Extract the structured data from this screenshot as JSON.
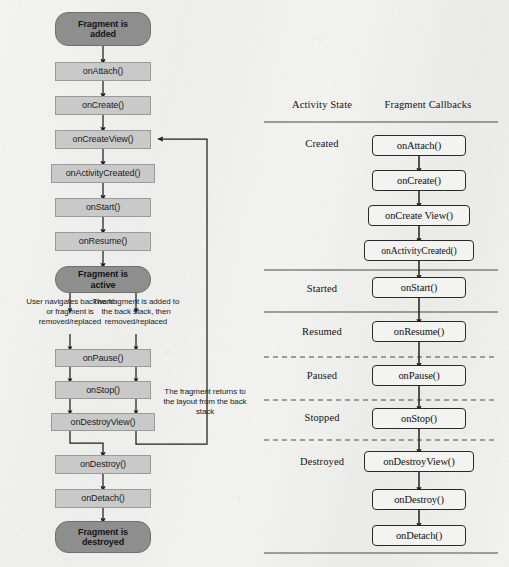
{
  "flow": {
    "start_node": "Fragment is\nadded",
    "start_line1": "Fragment is",
    "start_line2": "added",
    "active_line1": "Fragment is",
    "active_line2": "active",
    "end_line1": "Fragment is",
    "end_line2": "destroyed",
    "callbacks": [
      {
        "label": "onAttach()"
      },
      {
        "label": "onCreate()"
      },
      {
        "label": "onCreateView()"
      },
      {
        "label": "onActivityCreated()"
      },
      {
        "label": "onStart()"
      },
      {
        "label": "onResume()"
      },
      {
        "label": "onPause()"
      },
      {
        "label": "onStop()"
      },
      {
        "label": "onDestroyView()"
      },
      {
        "label": "onDestroy()"
      },
      {
        "label": "onDetach()"
      }
    ],
    "annotations": {
      "left_branch": "User navigates backward or fragment is removed/replaced",
      "right_branch": "The fragment is added to the back stack, then removed/replaced",
      "return_branch": "The fragment returns to the layout from the back stack"
    }
  },
  "table": {
    "headers": {
      "state": "Activity State",
      "callbacks": "Fragment Callbacks"
    },
    "rows": [
      {
        "state": "Created",
        "callbacks": [
          "onAttach()",
          "onCreate()",
          "onCreate View()",
          "onActivityCreated()"
        ],
        "separator": "solid"
      },
      {
        "state": "Started",
        "callbacks": [
          "onStart()"
        ],
        "separator": "solid"
      },
      {
        "state": "Resumed",
        "callbacks": [
          "onResume()"
        ],
        "separator": "dashed"
      },
      {
        "state": "Paused",
        "callbacks": [
          "onPause()"
        ],
        "separator": "dashed"
      },
      {
        "state": "Stopped",
        "callbacks": [
          "onStop()"
        ],
        "separator": "dashed"
      },
      {
        "state": "Destroyed",
        "callbacks": [
          "onDestroyView()",
          "onDestroy()",
          "onDetach()"
        ],
        "separator": "solid"
      }
    ]
  },
  "colors": {
    "background": "#f2f2f0",
    "terminal_fill": "#8e8e8e",
    "step_fill": "#c9c9c9",
    "step_stroke": "#9a9a9a",
    "box_stroke": "#2a2a2a",
    "arrow": "#1f1f1f",
    "rule": "#4a4a4a"
  }
}
